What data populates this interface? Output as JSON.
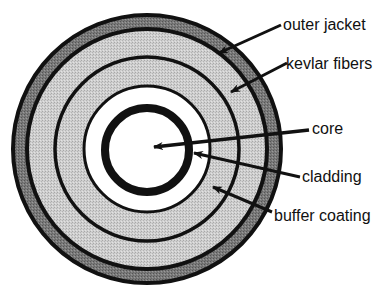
{
  "diagram": {
    "type": "fiber-optic-cable-cross-section",
    "center": {
      "x": 147,
      "y": 149
    },
    "colors": {
      "line": "#111111",
      "light_fill": "#c6c6c6",
      "jacket_fill": "#7a7a7a",
      "white": "#ffffff"
    },
    "labels": {
      "outer_jacket": "outer jacket",
      "kevlar_fibers": "kevlar fibers",
      "core": "core",
      "cladding": "cladding",
      "buffer_coating": "buffer coating"
    }
  }
}
